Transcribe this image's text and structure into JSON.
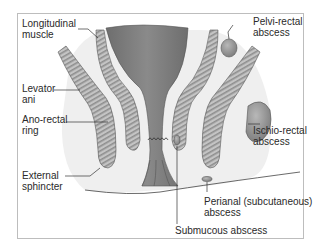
{
  "diagram": {
    "labels": {
      "longitudinal_muscle": [
        "Longitudinal",
        "muscle"
      ],
      "levator_ani": [
        "Levator",
        "ani"
      ],
      "anorectal_ring": [
        "Ano-rectal",
        "ring"
      ],
      "external_sphincter": [
        "External",
        "sphincter"
      ],
      "pelvirectal_abscess": [
        "Pelvi-rectal",
        "abscess"
      ],
      "ischiorectal_abscess": [
        "Ischio-rectal",
        "abscess"
      ],
      "perianal_abscess": [
        "Perianal (subcutaneous)",
        "abscess"
      ],
      "submucous_abscess": [
        "Submucous abscess"
      ]
    },
    "colors": {
      "rectum": "#7a7a7a",
      "muscle": "#b5b5b5",
      "muscle_stripe": "#8e8e8e",
      "abscess": "#9a9a9a",
      "fat_shading": "#ececec",
      "frame": "#bdbdbd",
      "text": "#2a2a2a"
    }
  }
}
